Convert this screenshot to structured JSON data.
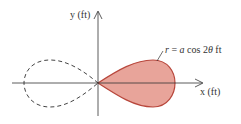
{
  "diagram": {
    "type": "polar-curve",
    "axes": {
      "x_label": "x (ft)",
      "y_label": "y (ft)"
    },
    "curve": {
      "equation_label": "r = a cos 2θ ft",
      "r": "r",
      "eq": "=",
      "a": "a",
      "cos": "cos 2",
      "theta": "θ",
      "unit": "ft"
    },
    "colors": {
      "fill": "#e8a49a",
      "stroke": "#b8473c",
      "axis": "#333333",
      "dashed": "#444444"
    }
  }
}
